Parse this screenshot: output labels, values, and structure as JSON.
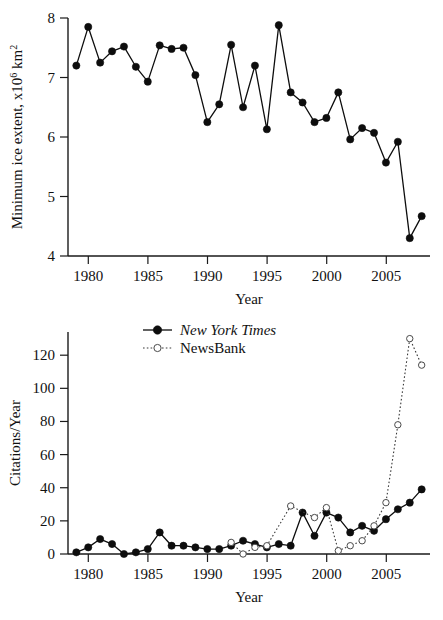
{
  "figure": {
    "background": "#ffffff",
    "ink_color": "#0d0d0d",
    "open_marker_color": "#4a4a4a",
    "caption_fragment": " "
  },
  "chart_data": [
    {
      "id": "arctic-minimum-ice-extent",
      "type": "line",
      "title": "",
      "xlabel": "Year",
      "ylabel": "Minimum ice extent, x10⁶ km²",
      "ylabel_parts": {
        "prefix": "Minimum ice extent, x10",
        "sup1": "6",
        "middle": " km",
        "sup2": "2"
      },
      "xlim": [
        1978.3,
        2008.7
      ],
      "ylim": [
        4,
        8
      ],
      "xticks": [
        1980,
        1985,
        1990,
        1995,
        2000,
        2005
      ],
      "xtick_labels": [
        "1980",
        "1985",
        "1990",
        "1995",
        "2000",
        "2005"
      ],
      "yticks": [
        4,
        5,
        6,
        7,
        8
      ],
      "ytick_labels": [
        "4",
        "5",
        "6",
        "7",
        "8"
      ],
      "grid": false,
      "legend": "none",
      "marker": "filled-circle",
      "line_style": "solid",
      "x": [
        1979,
        1980,
        1981,
        1982,
        1983,
        1984,
        1985,
        1986,
        1987,
        1988,
        1989,
        1990,
        1991,
        1992,
        1993,
        1994,
        1995,
        1996,
        1997,
        1998,
        1999,
        2000,
        2001,
        2002,
        2003,
        2004,
        2005,
        2006,
        2007,
        2008
      ],
      "values": [
        7.2,
        7.85,
        7.25,
        7.44,
        7.52,
        7.18,
        6.93,
        7.54,
        7.48,
        7.5,
        7.04,
        6.25,
        6.55,
        7.55,
        6.5,
        7.2,
        6.13,
        7.88,
        6.75,
        6.58,
        6.25,
        6.32,
        6.75,
        5.96,
        6.15,
        6.07,
        5.57,
        5.92,
        4.3,
        4.67
      ],
      "units": "million km^2"
    },
    {
      "id": "citations-per-year",
      "type": "line",
      "title": "",
      "xlabel": "Year",
      "ylabel": "Citations/Year",
      "xlim": [
        1978.3,
        2008.7
      ],
      "ylim": [
        0,
        134
      ],
      "xticks": [
        1980,
        1985,
        1990,
        1995,
        2000,
        2005
      ],
      "xtick_labels": [
        "1980",
        "1985",
        "1990",
        "1995",
        "2000",
        "2005"
      ],
      "yticks": [
        0,
        20,
        40,
        60,
        80,
        100,
        120
      ],
      "ytick_labels": [
        "0",
        "20",
        "40",
        "60",
        "80",
        "100",
        "120"
      ],
      "grid": false,
      "legend": "top-center",
      "series": [
        {
          "name": "New York Times",
          "style": "italic",
          "marker": "filled-circle",
          "line_style": "solid",
          "x": [
            1979,
            1980,
            1981,
            1982,
            1983,
            1984,
            1985,
            1986,
            1987,
            1988,
            1989,
            1990,
            1991,
            1992,
            1993,
            1994,
            1995,
            1996,
            1997,
            1998,
            1999,
            2000,
            2001,
            2002,
            2003,
            2004,
            2005,
            2006,
            2007,
            2008
          ],
          "values": [
            1,
            4,
            9,
            6,
            0,
            1,
            3,
            13,
            5,
            5,
            4,
            3,
            3,
            5,
            8,
            6,
            4,
            6,
            5,
            25,
            11,
            25,
            22,
            13,
            17,
            14,
            21,
            27,
            31,
            39,
            36
          ]
        },
        {
          "name": "NewsBank",
          "style": "regular",
          "marker": "open-circle",
          "line_style": "dotted",
          "x": [
            1992,
            1993,
            1994,
            1995,
            1997,
            1999,
            2000,
            2001,
            2002,
            2003,
            2004,
            2005,
            2006,
            2007,
            2008
          ],
          "values": [
            7,
            0,
            4,
            5,
            29,
            22,
            28,
            2,
            5,
            8,
            17,
            31,
            78,
            130,
            114
          ]
        }
      ]
    }
  ]
}
